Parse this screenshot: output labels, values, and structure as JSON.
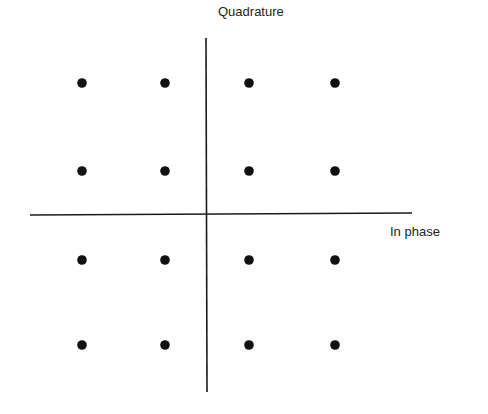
{
  "diagram": {
    "type": "constellation",
    "axes": {
      "vertical_label": "Quadrature",
      "horizontal_label": "In phase",
      "color": "#1a1a1a"
    },
    "points": {
      "color": "#111111",
      "columns_x": [
        82,
        165,
        249,
        335
      ],
      "rows_y": [
        83,
        171,
        260,
        345
      ],
      "count": 16
    }
  },
  "chart_data": {
    "type": "scatter",
    "title": "",
    "xlabel": "In phase",
    "ylabel": "Quadrature",
    "grid": false,
    "x": [
      -3,
      -1,
      1,
      3,
      -3,
      -1,
      1,
      3,
      -3,
      -1,
      1,
      3,
      -3,
      -1,
      1,
      3
    ],
    "y": [
      3,
      3,
      3,
      3,
      1,
      1,
      1,
      1,
      -1,
      -1,
      -1,
      -1,
      -3,
      -3,
      -3,
      -3
    ]
  }
}
